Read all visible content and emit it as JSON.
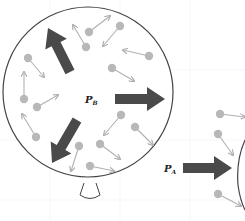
{
  "diagram": {
    "colors": {
      "outline": "#444444",
      "pressure_arrow": "#4a4a4a",
      "molecule": "#b8b8b8",
      "molecule_arrow": "#b0b0b0",
      "background": "#ffffff"
    },
    "balloon": {
      "label_main": "P",
      "label_sub": "B",
      "center": [
        88,
        92
      ],
      "radius": 85
    },
    "outside": {
      "label_main": "P",
      "label_sub": "A"
    },
    "pressure_arrows": [
      {
        "name": "up-left",
        "from": [
          70,
          72
        ],
        "to": [
          48,
          28
        ]
      },
      {
        "name": "right",
        "from": [
          115,
          99
        ],
        "to": [
          165,
          99
        ]
      },
      {
        "name": "down-left",
        "from": [
          77,
          120
        ],
        "to": [
          52,
          163
        ]
      },
      {
        "name": "outside-right",
        "from": [
          183,
          168
        ],
        "to": [
          232,
          168
        ]
      }
    ],
    "molecules": [
      {
        "at": [
          89,
          32
        ],
        "to": [
          110,
          16
        ]
      },
      {
        "at": [
          86,
          47
        ],
        "to": [
          73,
          25
        ]
      },
      {
        "at": [
          120,
          26
        ],
        "to": [
          103,
          46
        ]
      },
      {
        "at": [
          149,
          56
        ],
        "to": [
          123,
          50
        ]
      },
      {
        "at": [
          28,
          58
        ],
        "to": [
          44,
          77
        ]
      },
      {
        "at": [
          112,
          68
        ],
        "to": [
          134,
          81
        ]
      },
      {
        "at": [
          24,
          99
        ],
        "to": [
          24,
          72
        ]
      },
      {
        "at": [
          37,
          107
        ],
        "to": [
          58,
          95
        ]
      },
      {
        "at": [
          36,
          137
        ],
        "to": [
          22,
          114
        ]
      },
      {
        "at": [
          121,
          115
        ],
        "to": [
          104,
          135
        ]
      },
      {
        "at": [
          135,
          127
        ],
        "to": [
          153,
          145
        ]
      },
      {
        "at": [
          79,
          146
        ],
        "to": [
          71,
          171
        ]
      },
      {
        "at": [
          100,
          144
        ],
        "to": [
          120,
          159
        ]
      },
      {
        "at": [
          90,
          166
        ],
        "to": [
          114,
          171
        ]
      },
      {
        "at": [
          220,
          114
        ],
        "to": [
          245,
          117
        ]
      },
      {
        "at": [
          218,
          134
        ],
        "to": [
          233,
          155
        ]
      },
      {
        "at": [
          218,
          194
        ],
        "to": [
          241,
          206
        ]
      }
    ]
  }
}
